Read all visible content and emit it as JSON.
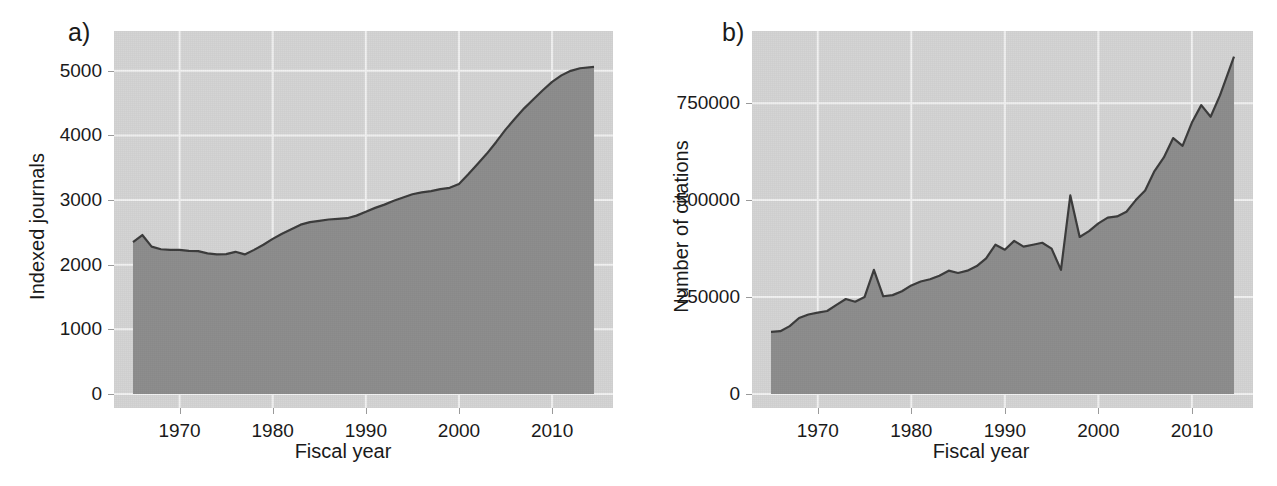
{
  "figure": {
    "background_color": "#ffffff",
    "panel_background_color": "#d5d5d5",
    "area_fill_color": "#8e8e8e",
    "line_color": "#3d3d3d",
    "grid_color": "#f2f2f2",
    "text_color": "#1a1a1a"
  },
  "panel_a": {
    "tag": "a)",
    "ylabel": "Indexed journals",
    "xlabel": "Fiscal year",
    "ytick_labels": [
      "0",
      "1000",
      "2000",
      "3000",
      "4000",
      "5000"
    ],
    "xtick_labels": [
      "1970",
      "1980",
      "1990",
      "2000",
      "2010"
    ]
  },
  "panel_b": {
    "tag": "b)",
    "ylabel": "Number of citations",
    "xlabel": "Fiscal year",
    "ytick_labels": [
      "0",
      "250000",
      "500000",
      "750000"
    ],
    "xtick_labels": [
      "1970",
      "1980",
      "1990",
      "2000",
      "2010"
    ]
  },
  "chart_data": [
    {
      "id": "panel_a",
      "type": "area",
      "title": "a)",
      "xlabel": "Fiscal year",
      "ylabel": "Indexed journals",
      "xlim": [
        1965,
        2014.5
      ],
      "ylim": [
        0,
        5400
      ],
      "yticks": [
        0,
        1000,
        2000,
        3000,
        4000,
        5000
      ],
      "xticks": [
        1970,
        1980,
        1990,
        2000,
        2010
      ],
      "grid": true,
      "legend": "none",
      "x": [
        1965,
        1966,
        1967,
        1968,
        1969,
        1970,
        1971,
        1972,
        1973,
        1974,
        1975,
        1976,
        1977,
        1978,
        1979,
        1980,
        1981,
        1982,
        1983,
        1984,
        1985,
        1986,
        1987,
        1988,
        1989,
        1990,
        1991,
        1992,
        1993,
        1994,
        1995,
        1996,
        1997,
        1998,
        1999,
        2000,
        2001,
        2002,
        2003,
        2004,
        2005,
        2006,
        2007,
        2008,
        2009,
        2010,
        2011,
        2012,
        2013,
        2014.5
      ],
      "values": [
        2350,
        2460,
        2280,
        2240,
        2230,
        2230,
        2215,
        2210,
        2175,
        2160,
        2165,
        2200,
        2160,
        2230,
        2310,
        2400,
        2480,
        2550,
        2620,
        2660,
        2680,
        2700,
        2710,
        2720,
        2760,
        2820,
        2880,
        2930,
        2990,
        3040,
        3090,
        3120,
        3140,
        3170,
        3190,
        3250,
        3400,
        3560,
        3720,
        3900,
        4090,
        4260,
        4420,
        4560,
        4700,
        4830,
        4930,
        5000,
        5040,
        5060
      ]
    },
    {
      "id": "panel_b",
      "type": "area",
      "title": "b)",
      "xlabel": "Fiscal year",
      "ylabel": "Number of citations",
      "xlim": [
        1965,
        2014.5
      ],
      "ylim": [
        0,
        900000
      ],
      "yticks": [
        0,
        250000,
        500000,
        750000
      ],
      "xticks": [
        1970,
        1980,
        1990,
        2000,
        2010
      ],
      "grid": true,
      "legend": "none",
      "x": [
        1965,
        1966,
        1967,
        1968,
        1969,
        1970,
        1971,
        1972,
        1973,
        1974,
        1975,
        1976,
        1977,
        1978,
        1979,
        1980,
        1981,
        1982,
        1983,
        1984,
        1985,
        1986,
        1987,
        1988,
        1989,
        1990,
        1991,
        1992,
        1993,
        1994,
        1995,
        1996,
        1997,
        1998,
        1999,
        2000,
        2001,
        2002,
        2003,
        2004,
        2005,
        2006,
        2007,
        2008,
        2009,
        2010,
        2011,
        2012,
        2013,
        2014.5
      ],
      "values": [
        160000,
        162000,
        175000,
        196000,
        205000,
        210000,
        214000,
        230000,
        245000,
        238000,
        250000,
        320000,
        252000,
        255000,
        265000,
        280000,
        290000,
        296000,
        305000,
        318000,
        312000,
        318000,
        330000,
        350000,
        385000,
        372000,
        395000,
        380000,
        385000,
        390000,
        375000,
        320000,
        512000,
        405000,
        420000,
        440000,
        455000,
        458000,
        470000,
        500000,
        525000,
        575000,
        610000,
        660000,
        640000,
        700000,
        745000,
        715000,
        770000,
        870000
      ]
    }
  ]
}
